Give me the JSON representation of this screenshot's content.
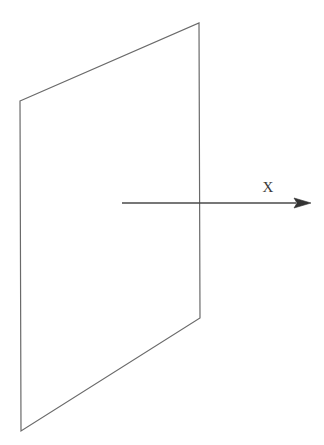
{
  "figure": {
    "canvas": {
      "width": 324,
      "height": 445
    },
    "background_color": "#ffffff",
    "stroke_color": "#6a6a6a",
    "axis_color": "#4a4a4a",
    "label_color": "#3a3a3a",
    "stroke_width": 1.2,
    "axis_stroke_width": 1.4
  },
  "plane": {
    "name": "plane-quadrilateral",
    "description": "quadrilateral representing a plane seen edge-on in perspective",
    "points": "20,101 199,23 200,318 21,431",
    "corners": {
      "top_left": {
        "x": 20,
        "y": 101
      },
      "top_right": {
        "x": 199,
        "y": 23
      },
      "bottom_right": {
        "x": 200,
        "y": 318
      },
      "bottom_left": {
        "x": 21,
        "y": 431
      }
    },
    "fill": "none"
  },
  "axis": {
    "name": "x-axis",
    "label": "X",
    "label_x": 268,
    "label_y": 192,
    "line": {
      "x1": 122,
      "y1": 203,
      "x2": 296,
      "y2": 203
    },
    "arrowhead": {
      "points": "311,203 294,198 297,203 294,208",
      "tip": {
        "x": 311,
        "y": 203
      }
    }
  }
}
